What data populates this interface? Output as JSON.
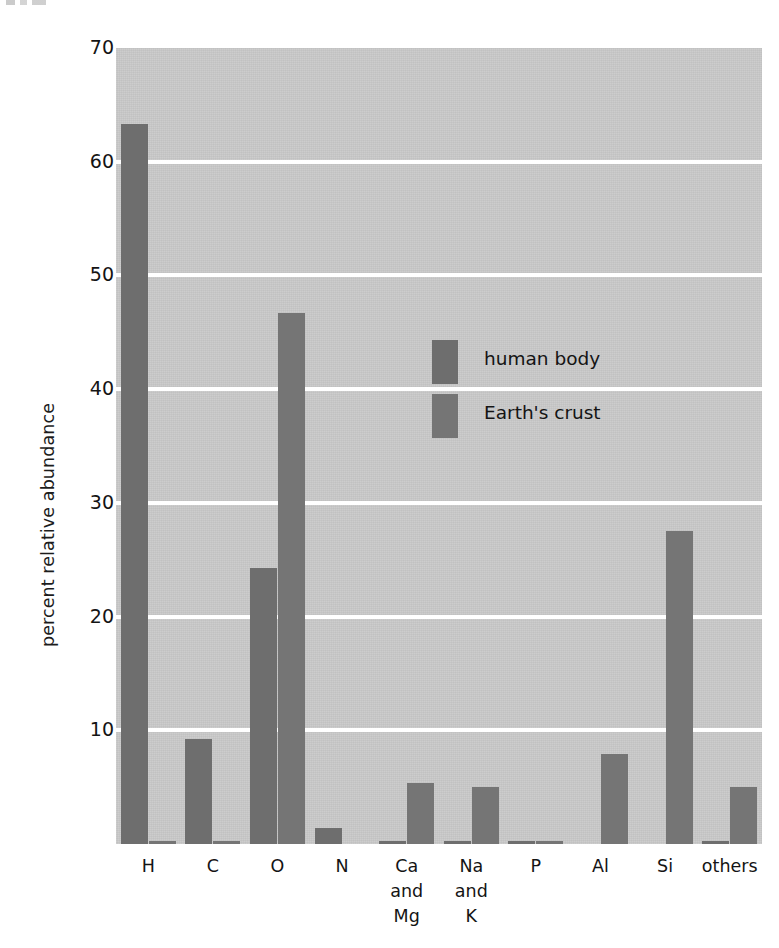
{
  "figure": {
    "y_axis_title": "percent relative abundance",
    "y_ticks": [
      "70",
      "60",
      "50",
      "40",
      "30",
      "20",
      "10"
    ],
    "x_ticks": [
      {
        "lines": [
          "H"
        ]
      },
      {
        "lines": [
          "C"
        ]
      },
      {
        "lines": [
          "O"
        ]
      },
      {
        "lines": [
          "N"
        ]
      },
      {
        "lines": [
          "Ca",
          "and",
          "Mg"
        ]
      },
      {
        "lines": [
          "Na",
          "and",
          "K"
        ]
      },
      {
        "lines": [
          "P"
        ]
      },
      {
        "lines": [
          "Al"
        ]
      },
      {
        "lines": [
          "Si"
        ]
      },
      {
        "lines": [
          "others"
        ]
      }
    ],
    "legend": [
      {
        "key": "human_body",
        "label": "human body",
        "color": "#6e6e6e"
      },
      {
        "key": "earths_crust",
        "label": "Earth's crust",
        "color": "#757575"
      }
    ],
    "colors": {
      "plot_background": "#c9c9c9",
      "gridline": "#ffffff",
      "human_body_bar": "#6e6e6e",
      "earths_crust_bar": "#757575",
      "text": "#141414",
      "page_background": "#ffffff"
    }
  },
  "chart_data": {
    "type": "bar",
    "title": "",
    "subtitle": "",
    "xlabel": "",
    "ylabel": "percent relative abundance",
    "ylim": [
      0,
      70
    ],
    "ytick_values": [
      10,
      20,
      30,
      40,
      50,
      60,
      70
    ],
    "grid": "horizontal",
    "legend_position": "inside-center-upper",
    "categories": [
      "H",
      "C",
      "O",
      "N",
      "Ca and Mg",
      "Na and K",
      "P",
      "Al",
      "Si",
      "others"
    ],
    "series": [
      {
        "name": "human body",
        "color": "#6e6e6e",
        "values": [
          63.3,
          9.2,
          24.3,
          1.4,
          0.3,
          0.3,
          0.2,
          0.0,
          0.0,
          0.2
        ]
      },
      {
        "name": "Earth's crust",
        "color": "#757575",
        "values": [
          0.3,
          0.2,
          46.7,
          0.0,
          5.4,
          5.0,
          0.1,
          7.9,
          27.5,
          5.0
        ]
      }
    ]
  }
}
